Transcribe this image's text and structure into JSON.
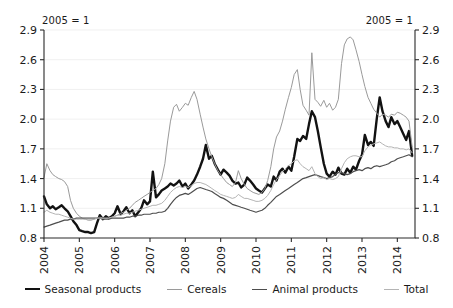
{
  "annotations": {
    "left_note": "2005 = 1",
    "right_note": "2005 = 1"
  },
  "legend": {
    "items": [
      {
        "label": "Seasonal products",
        "color": "#121212",
        "width": 2.4
      },
      {
        "label": "Cereals",
        "color": "#9a9a9a",
        "width": 1.0
      },
      {
        "label": "Animal products",
        "color": "#4d4d4d",
        "width": 1.2
      },
      {
        "label": "Total",
        "color": "#b4b4b4",
        "width": 1.0
      }
    ]
  },
  "chart_data": {
    "type": "line",
    "title": "",
    "subtitle": "",
    "xlabel": "",
    "ylabel": "",
    "unit_note": "2005 = 1",
    "grid": true,
    "legend_position": "bottom",
    "xlim": [
      2004.0,
      2014.5
    ],
    "ylim": [
      0.8,
      2.9
    ],
    "yticks": [
      0.8,
      1.1,
      1.4,
      1.7,
      2.0,
      2.3,
      2.6,
      2.9
    ],
    "ytick_labels": [
      "0.8",
      "1.1",
      "1.4",
      "1.7",
      "2.0",
      "2.3",
      "2.6",
      "2.9"
    ],
    "xticks": [
      2004,
      2005,
      2006,
      2007,
      2008,
      2009,
      2010,
      2011,
      2012,
      2013,
      2014
    ],
    "xtick_labels": [
      "2004",
      "2005",
      "2006",
      "2007",
      "2008",
      "2009",
      "2010",
      "2011",
      "2012",
      "2013",
      "2014"
    ],
    "x": [
      2004.0,
      2004.08,
      2004.17,
      2004.25,
      2004.33,
      2004.42,
      2004.5,
      2004.58,
      2004.67,
      2004.75,
      2004.83,
      2004.92,
      2005.0,
      2005.08,
      2005.17,
      2005.25,
      2005.33,
      2005.42,
      2005.5,
      2005.58,
      2005.67,
      2005.75,
      2005.83,
      2005.92,
      2006.0,
      2006.08,
      2006.17,
      2006.25,
      2006.33,
      2006.42,
      2006.5,
      2006.58,
      2006.67,
      2006.75,
      2006.83,
      2006.92,
      2007.0,
      2007.08,
      2007.17,
      2007.25,
      2007.33,
      2007.42,
      2007.5,
      2007.58,
      2007.67,
      2007.75,
      2007.83,
      2007.92,
      2008.0,
      2008.08,
      2008.17,
      2008.25,
      2008.33,
      2008.42,
      2008.5,
      2008.58,
      2008.67,
      2008.75,
      2008.83,
      2008.92,
      2009.0,
      2009.08,
      2009.17,
      2009.25,
      2009.33,
      2009.42,
      2009.5,
      2009.58,
      2009.67,
      2009.75,
      2009.83,
      2009.92,
      2010.0,
      2010.08,
      2010.17,
      2010.25,
      2010.33,
      2010.42,
      2010.5,
      2010.58,
      2010.67,
      2010.75,
      2010.83,
      2010.92,
      2011.0,
      2011.08,
      2011.17,
      2011.25,
      2011.33,
      2011.42,
      2011.5,
      2011.58,
      2011.67,
      2011.75,
      2011.83,
      2011.92,
      2012.0,
      2012.08,
      2012.17,
      2012.25,
      2012.33,
      2012.42,
      2012.5,
      2012.58,
      2012.67,
      2012.75,
      2012.83,
      2012.92,
      2013.0,
      2013.08,
      2013.17,
      2013.25,
      2013.33,
      2013.42,
      2013.5,
      2013.58,
      2013.67,
      2013.75,
      2013.83,
      2013.92,
      2014.0,
      2014.08,
      2014.17,
      2014.25,
      2014.33,
      2014.42
    ],
    "series": [
      {
        "name": "Seasonal products",
        "color": "#121212",
        "width": 2.4,
        "values": [
          1.22,
          1.14,
          1.1,
          1.12,
          1.09,
          1.11,
          1.13,
          1.1,
          1.07,
          1.02,
          0.97,
          0.93,
          0.88,
          0.87,
          0.86,
          0.86,
          0.85,
          0.86,
          0.95,
          1.03,
          0.99,
          1.02,
          1.0,
          1.02,
          1.05,
          1.12,
          1.04,
          1.07,
          1.11,
          1.05,
          1.08,
          1.02,
          1.06,
          1.1,
          1.18,
          1.14,
          1.17,
          1.47,
          1.21,
          1.24,
          1.28,
          1.3,
          1.32,
          1.35,
          1.33,
          1.35,
          1.38,
          1.32,
          1.35,
          1.3,
          1.34,
          1.38,
          1.44,
          1.52,
          1.6,
          1.74,
          1.6,
          1.63,
          1.55,
          1.49,
          1.44,
          1.49,
          1.46,
          1.43,
          1.38,
          1.35,
          1.36,
          1.31,
          1.34,
          1.41,
          1.38,
          1.34,
          1.3,
          1.28,
          1.26,
          1.3,
          1.34,
          1.32,
          1.42,
          1.38,
          1.47,
          1.5,
          1.46,
          1.52,
          1.48,
          1.62,
          1.8,
          1.78,
          1.83,
          1.8,
          1.95,
          2.08,
          2.02,
          1.88,
          1.72,
          1.55,
          1.45,
          1.42,
          1.47,
          1.44,
          1.51,
          1.45,
          1.44,
          1.5,
          1.46,
          1.52,
          1.49,
          1.58,
          1.64,
          1.84,
          1.74,
          1.77,
          1.73,
          2.01,
          2.22,
          2.08,
          1.98,
          1.92,
          2.02,
          1.95,
          1.98,
          1.92,
          1.85,
          1.79,
          1.88,
          1.63
        ]
      },
      {
        "name": "Cereals",
        "color": "#9a9a9a",
        "width": 1.0,
        "values": [
          1.41,
          1.55,
          1.48,
          1.44,
          1.42,
          1.4,
          1.39,
          1.37,
          1.32,
          1.18,
          1.1,
          1.05,
          1.02,
          1.0,
          0.99,
          0.98,
          0.98,
          0.99,
          1.0,
          1.01,
          1.0,
          1.0,
          1.0,
          1.01,
          1.02,
          1.03,
          1.05,
          1.06,
          1.08,
          1.1,
          1.13,
          1.16,
          1.18,
          1.2,
          1.22,
          1.24,
          1.26,
          1.28,
          1.3,
          1.34,
          1.4,
          1.55,
          1.78,
          1.98,
          2.12,
          2.15,
          2.08,
          2.12,
          2.16,
          2.14,
          2.22,
          2.28,
          2.2,
          2.05,
          1.92,
          1.8,
          1.7,
          1.62,
          1.55,
          1.48,
          1.44,
          1.4,
          1.36,
          1.34,
          1.32,
          1.36,
          1.48,
          1.4,
          1.34,
          1.3,
          1.28,
          1.26,
          1.25,
          1.24,
          1.26,
          1.3,
          1.38,
          1.52,
          1.7,
          1.82,
          1.88,
          1.98,
          2.1,
          2.22,
          2.32,
          2.45,
          2.5,
          2.3,
          2.14,
          2.09,
          2.04,
          2.67,
          2.2,
          2.17,
          2.13,
          2.19,
          2.12,
          2.16,
          2.09,
          2.12,
          2.2,
          2.56,
          2.75,
          2.81,
          2.83,
          2.8,
          2.7,
          2.58,
          2.45,
          2.33,
          2.22,
          2.16,
          2.1,
          2.06,
          2.02,
          2.05,
          2.04,
          2.02,
          2.05,
          2.04,
          2.07,
          2.06,
          2.04,
          2.02,
          1.98,
          1.72
        ]
      },
      {
        "name": "Animal products",
        "color": "#4d4d4d",
        "width": 1.2,
        "values": [
          0.91,
          0.92,
          0.93,
          0.94,
          0.95,
          0.96,
          0.97,
          0.98,
          0.98,
          0.99,
          0.99,
          1.0,
          1.0,
          1.0,
          1.0,
          1.0,
          1.0,
          1.0,
          1.0,
          1.0,
          0.99,
          0.99,
          0.99,
          1.0,
          1.0,
          1.0,
          1.0,
          1.0,
          1.01,
          1.01,
          1.02,
          1.02,
          1.03,
          1.03,
          1.04,
          1.04,
          1.04,
          1.05,
          1.05,
          1.06,
          1.06,
          1.07,
          1.1,
          1.14,
          1.18,
          1.21,
          1.23,
          1.24,
          1.25,
          1.24,
          1.26,
          1.28,
          1.3,
          1.31,
          1.3,
          1.29,
          1.28,
          1.27,
          1.25,
          1.23,
          1.21,
          1.2,
          1.18,
          1.16,
          1.14,
          1.13,
          1.12,
          1.11,
          1.1,
          1.09,
          1.08,
          1.07,
          1.06,
          1.07,
          1.08,
          1.1,
          1.13,
          1.16,
          1.19,
          1.22,
          1.24,
          1.26,
          1.28,
          1.3,
          1.32,
          1.34,
          1.36,
          1.38,
          1.4,
          1.41,
          1.42,
          1.43,
          1.44,
          1.43,
          1.42,
          1.41,
          1.4,
          1.41,
          1.42,
          1.44,
          1.46,
          1.46,
          1.45,
          1.44,
          1.45,
          1.47,
          1.48,
          1.49,
          1.48,
          1.5,
          1.51,
          1.5,
          1.52,
          1.53,
          1.52,
          1.53,
          1.54,
          1.55,
          1.57,
          1.58,
          1.6,
          1.61,
          1.62,
          1.63,
          1.64,
          1.62
        ]
      },
      {
        "name": "Total",
        "color": "#b4b4b4",
        "width": 1.0,
        "values": [
          1.06,
          1.08,
          1.06,
          1.05,
          1.04,
          1.04,
          1.03,
          1.02,
          1.01,
          1.0,
          0.99,
          0.99,
          0.99,
          0.99,
          0.99,
          0.99,
          0.99,
          0.99,
          1.0,
          1.0,
          1.0,
          1.0,
          1.0,
          1.01,
          1.02,
          1.03,
          1.03,
          1.04,
          1.05,
          1.05,
          1.06,
          1.07,
          1.08,
          1.09,
          1.1,
          1.11,
          1.12,
          1.13,
          1.13,
          1.14,
          1.15,
          1.18,
          1.22,
          1.26,
          1.29,
          1.31,
          1.32,
          1.31,
          1.32,
          1.31,
          1.33,
          1.35,
          1.36,
          1.36,
          1.35,
          1.34,
          1.32,
          1.3,
          1.28,
          1.26,
          1.24,
          1.23,
          1.22,
          1.21,
          1.2,
          1.21,
          1.24,
          1.22,
          1.2,
          1.2,
          1.19,
          1.18,
          1.17,
          1.17,
          1.18,
          1.2,
          1.23,
          1.28,
          1.34,
          1.39,
          1.43,
          1.47,
          1.5,
          1.53,
          1.55,
          1.58,
          1.59,
          1.55,
          1.52,
          1.5,
          1.48,
          1.52,
          1.45,
          1.42,
          1.4,
          1.41,
          1.39,
          1.4,
          1.39,
          1.4,
          1.42,
          1.5,
          1.56,
          1.6,
          1.62,
          1.63,
          1.63,
          1.62,
          1.62,
          1.68,
          1.72,
          1.74,
          1.75,
          1.76,
          1.77,
          1.75,
          1.73,
          1.72,
          1.72,
          1.71,
          1.71,
          1.7,
          1.7,
          1.69,
          1.7,
          1.66
        ]
      }
    ]
  }
}
